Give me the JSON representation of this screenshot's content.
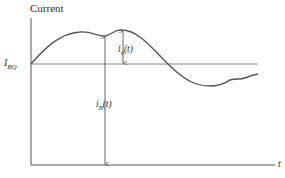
{
  "diagram": {
    "y_axis_label": "Current",
    "x_axis_label": "t",
    "dc_level_label": {
      "main": "I",
      "sub": "BQ"
    },
    "ac_component_label": {
      "main": "i",
      "sub": "b",
      "arg": "(t)"
    },
    "total_current_label": {
      "main": "i",
      "sub": "B",
      "arg": "(t)"
    },
    "colors": {
      "axis": "#555555",
      "curve": "#555555",
      "dc_line": "#777777",
      "text": "#333333"
    }
  }
}
